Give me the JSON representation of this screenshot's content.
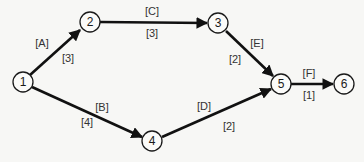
{
  "diagram": {
    "type": "activity-network",
    "nodes": [
      {
        "id": "1",
        "label": "1",
        "x": 23,
        "y": 82
      },
      {
        "id": "2",
        "label": "2",
        "x": 90,
        "y": 22
      },
      {
        "id": "3",
        "label": "3",
        "x": 218,
        "y": 23
      },
      {
        "id": "4",
        "label": "4",
        "x": 152,
        "y": 141
      },
      {
        "id": "5",
        "label": "5",
        "x": 281,
        "y": 84
      },
      {
        "id": "6",
        "label": "6",
        "x": 344,
        "y": 84
      }
    ],
    "edges": [
      {
        "from": "1",
        "to": "2",
        "activity": "[A]",
        "duration": "[3]"
      },
      {
        "from": "1",
        "to": "4",
        "activity": "[B]",
        "duration": "[4]"
      },
      {
        "from": "2",
        "to": "3",
        "activity": "[C]",
        "duration": "[3]"
      },
      {
        "from": "4",
        "to": "5",
        "activity": "[D]",
        "duration": "[2]"
      },
      {
        "from": "3",
        "to": "5",
        "activity": "[E]",
        "duration": "[2]"
      },
      {
        "from": "5",
        "to": "6",
        "activity": "[F]",
        "duration": "[1]"
      }
    ]
  }
}
